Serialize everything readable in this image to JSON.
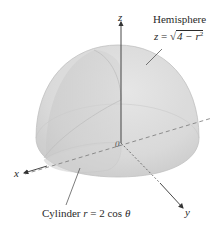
{
  "figure": {
    "hemisphere_label": {
      "title": "Hemisphere",
      "lhs": "z",
      "equals": "=",
      "radical_sign": "√",
      "radicand": "4 − r",
      "exponent": "2"
    },
    "cylinder_label": {
      "title": "Cylinder",
      "lhs": "r",
      "rhs": "= 2 cos",
      "theta": "θ"
    },
    "axes": {
      "x": "x",
      "y": "y",
      "z": "z",
      "origin": "0"
    },
    "colors": {
      "hemisphere_fill": "#d9d9d9",
      "hemisphere_shade": "#c9c9c9",
      "cylinder_fill": "#cfcfcf",
      "axis_line": "#333333",
      "text": "#2a2a2a"
    }
  }
}
